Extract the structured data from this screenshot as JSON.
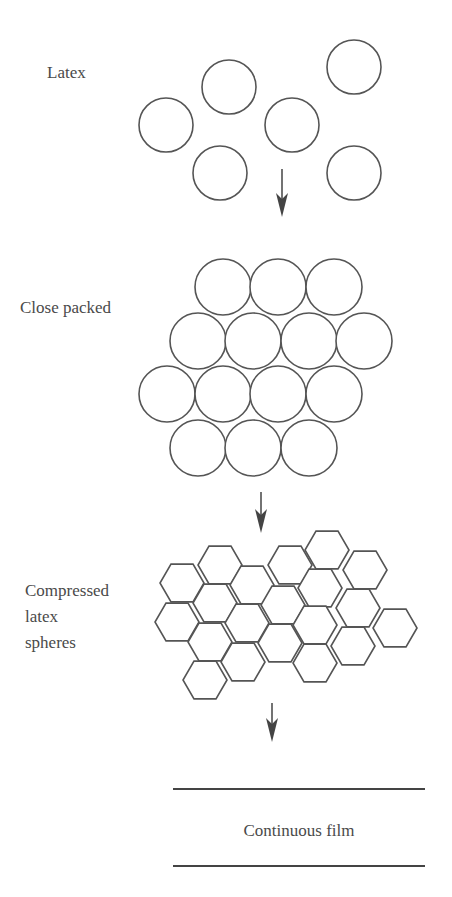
{
  "stages": {
    "latex": {
      "label": "Latex"
    },
    "close_packed": {
      "label": "Close packed"
    },
    "compressed": {
      "label_lines": [
        "Compressed",
        "latex",
        "spheres"
      ]
    },
    "film": {
      "label": "Continuous film"
    }
  },
  "colors": {
    "stroke": "#555555",
    "text": "#4a4a4a",
    "background": "#ffffff"
  },
  "geometry": {
    "latex_circles": [
      [
        166,
        125
      ],
      [
        229,
        87
      ],
      [
        292,
        125
      ],
      [
        354,
        67
      ],
      [
        220,
        173
      ],
      [
        354,
        173
      ]
    ],
    "latex_radius": 27,
    "close_packed_circles": [
      [
        223,
        287
      ],
      [
        278,
        287
      ],
      [
        334,
        287
      ],
      [
        198,
        341
      ],
      [
        253,
        341
      ],
      [
        309,
        341
      ],
      [
        364,
        341
      ],
      [
        167,
        394
      ],
      [
        223,
        394
      ],
      [
        278,
        394
      ],
      [
        334,
        394
      ],
      [
        198,
        448
      ],
      [
        253,
        448
      ],
      [
        309,
        448
      ]
    ],
    "close_packed_radius": 28,
    "hexagons": [
      [
        182,
        583
      ],
      [
        220,
        565
      ],
      [
        177,
        622
      ],
      [
        215,
        603
      ],
      [
        252,
        585
      ],
      [
        290,
        565
      ],
      [
        327,
        550
      ],
      [
        210,
        642
      ],
      [
        247,
        623
      ],
      [
        283,
        605
      ],
      [
        320,
        588
      ],
      [
        205,
        680
      ],
      [
        243,
        662
      ],
      [
        280,
        643
      ],
      [
        315,
        625
      ],
      [
        315,
        663
      ],
      [
        365,
        570
      ],
      [
        358,
        608
      ],
      [
        395,
        628
      ],
      [
        353,
        646
      ]
    ],
    "hex_radius": 22,
    "arrows": [
      {
        "x": 282,
        "y1": 169,
        "y2": 217
      },
      {
        "x": 261,
        "y1": 492,
        "y2": 533
      },
      {
        "x": 272,
        "y1": 703,
        "y2": 742
      }
    ],
    "film_lines": [
      {
        "x1": 173,
        "x2": 425,
        "y": 789
      },
      {
        "x1": 173,
        "x2": 425,
        "y": 866
      }
    ]
  }
}
